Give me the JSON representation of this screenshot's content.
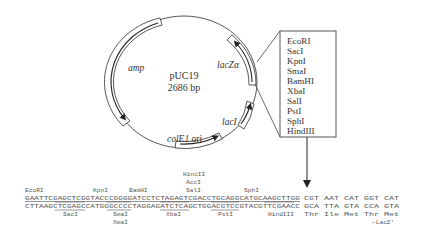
{
  "plasmid": {
    "name": "pUC19",
    "size": "2686 bp"
  },
  "features": [
    {
      "label": "amp",
      "italic": true
    },
    {
      "label": "lacZα",
      "italic": true
    },
    {
      "label": "lacI",
      "italic": true
    },
    {
      "label_italic": "colE1",
      "label_rest": " ori"
    }
  ],
  "mcs_box": {
    "sites": [
      "EcoRI",
      "SacI",
      "KpnI",
      "SmaI",
      "BamHI",
      "XbaI",
      "SalI",
      "PstI",
      "SphI",
      "HindIII"
    ]
  },
  "sequence": {
    "top_labels": {
      "ecori": "EcoRI",
      "kpni": "KpnI",
      "bamhi": "BamHI",
      "hincii": "HincII",
      "acci": "AccI",
      "sali": "SalI",
      "sphi": "SphI"
    },
    "top_strand": "GAATTCGAGCTCGGTACCCGGGGATCCTCTAGAGTCGACCTGCAGGCATGCAAGCTTGG",
    "top_codons": "CGT AAT CAT GGT CAT",
    "bottom_strand": "CTTAAGCTCGAGCCATGGGCCCCTAGGAGATCTCAGCTGGACGTCCGTACGTTCGAACC",
    "bottom_codons": "GCA TTA GTA CCA GTA",
    "bottom_labels": {
      "saci": "SacI",
      "smai": "SmaI",
      "xmai": "XmaI",
      "xbai": "XbaI",
      "psti": "PstI",
      "hindiii": "HindIII"
    },
    "amino_acids": "Thr Ile Met Thr Met",
    "lacz_label": "←LacZ'"
  }
}
